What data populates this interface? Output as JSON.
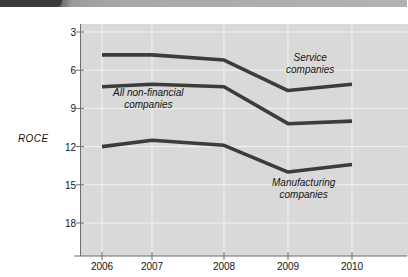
{
  "figure": {
    "background_color": "#ffffff",
    "panel_color": "#d9d9d9",
    "line_color": "#3c3c3c",
    "grid_color": "#f0f0f0",
    "axis_color": "#6d6d6d"
  },
  "top_bar": {
    "dark_color": "#3a3a3a",
    "light_color": "#b2b2b2"
  },
  "axes": {
    "y_label": "ROCE",
    "y_ticks": [
      "18",
      "15",
      "12",
      "9",
      "6",
      "3"
    ],
    "x_ticks": [
      "2006",
      "2007",
      "2008",
      "2009",
      "2010"
    ]
  },
  "annotations": {
    "service": {
      "line1": "Service",
      "line2": "companies"
    },
    "all_non_financial": {
      "line1": "All non-financial",
      "line2": "companies"
    },
    "manufacturing": {
      "line1": "Manufacturing",
      "line2": "companies"
    }
  },
  "chart_data": {
    "type": "line",
    "title": "",
    "xlabel": "",
    "ylabel": "ROCE",
    "x": [
      "2006",
      "2007",
      "2008",
      "2009",
      "2010"
    ],
    "categories": [
      "2006",
      "2007",
      "2008",
      "2009",
      "2010"
    ],
    "ylim": [
      0,
      18
    ],
    "y_ticks": [
      3,
      6,
      9,
      12,
      15,
      18
    ],
    "grid": true,
    "legend": "annotations-inline",
    "series": [
      {
        "name": "Service companies",
        "values": [
          16.2,
          16.2,
          15.8,
          13.4,
          13.9
        ]
      },
      {
        "name": "All non-financial companies",
        "values": [
          13.7,
          13.9,
          13.7,
          10.8,
          11.0
        ]
      },
      {
        "name": "Manufacturing companies",
        "values": [
          9.0,
          9.5,
          9.1,
          7.0,
          7.6
        ]
      }
    ]
  }
}
